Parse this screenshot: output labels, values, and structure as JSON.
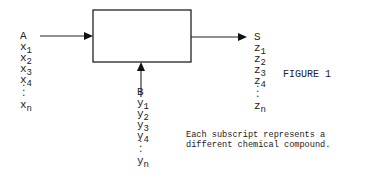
{
  "diagram": {
    "box": {
      "x": 93,
      "y": 10,
      "width": 98,
      "height": 52
    },
    "input_a": {
      "label": "A",
      "var": "x",
      "subscripts": [
        "1",
        "2",
        "3",
        "4",
        "n"
      ],
      "ellipsis": "⋮"
    },
    "input_b": {
      "label": "B",
      "var": "y",
      "subscripts": [
        "1",
        "2",
        "3",
        "4",
        "n"
      ],
      "ellipsis": "⋮"
    },
    "output_s": {
      "label": "S",
      "var": "z",
      "subscripts": [
        "1",
        "2",
        "3",
        "4",
        "n"
      ],
      "ellipsis": "⋮"
    },
    "figure_label": "FIGURE 1",
    "caption_line1": "Each subscript represents a",
    "caption_line2": "different chemical compound.",
    "line_color": "#111111"
  }
}
